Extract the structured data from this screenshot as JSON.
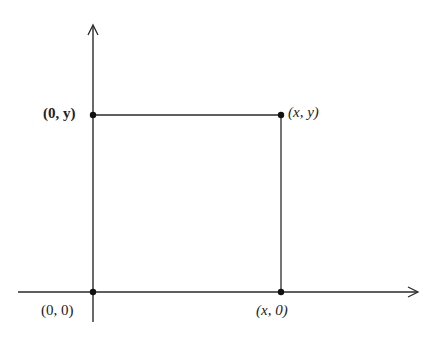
{
  "diagram": {
    "title": "",
    "colors": {
      "line": "#2a2a2a",
      "point": "#111111",
      "background": "#ffffff"
    },
    "axes": {
      "x_axis": {
        "from": [
          18,
          292
        ],
        "to": [
          418,
          292
        ],
        "arrow": "right"
      },
      "y_axis": {
        "from": [
          93,
          322
        ],
        "to": [
          93,
          25
        ],
        "arrow": "up"
      }
    },
    "points": [
      {
        "id": "origin",
        "label": "(0, 0)",
        "pos": [
          93,
          292
        ]
      },
      {
        "id": "x0",
        "label": "(x, 0)",
        "pos": [
          281,
          292
        ]
      },
      {
        "id": "0y",
        "label": "(0, y)",
        "pos": [
          93,
          115
        ]
      },
      {
        "id": "xy",
        "label": "(x, y)",
        "pos": [
          281,
          115
        ]
      }
    ],
    "labels": {
      "origin": "(0, 0)",
      "x0": "(x, 0)",
      "zero_y": "(0, y)",
      "xy": "(x, y)"
    }
  }
}
